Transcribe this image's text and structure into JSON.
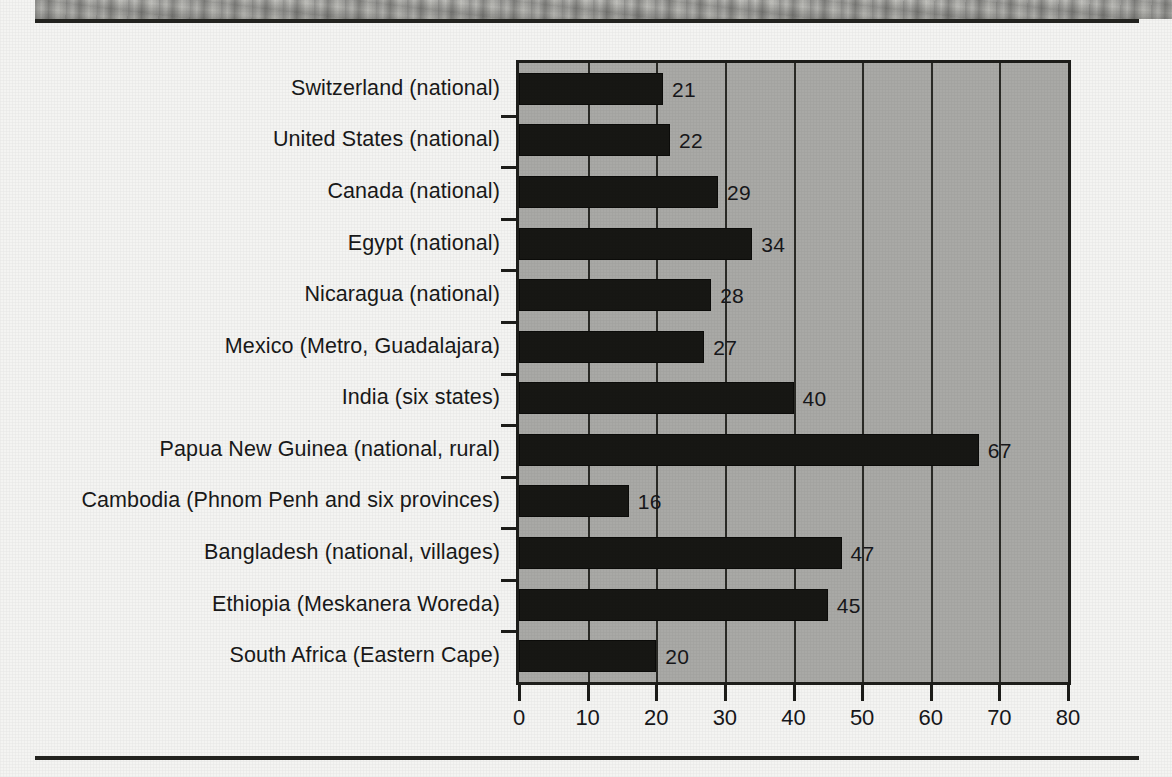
{
  "figure": {
    "background_color": "#f4f4f2",
    "plot_background_color": "#a9a9a6",
    "bar_color": "#171714",
    "axis_color": "#1d1d1a"
  },
  "chart_data": {
    "type": "bar",
    "orientation": "horizontal",
    "title": "",
    "subtitle": "",
    "xlabel": "",
    "ylabel": "",
    "xlim": [
      0,
      80
    ],
    "xticks": [
      0,
      10,
      20,
      30,
      40,
      50,
      60,
      70,
      80
    ],
    "xticklabels": [
      "0",
      "10",
      "20",
      "30",
      "40",
      "50",
      "60",
      "70",
      "80"
    ],
    "grid": true,
    "grid_axis": "x",
    "legend": false,
    "legend_position": "none",
    "data_labels": true,
    "categories": [
      "Switzerland (national)",
      "United States (national)",
      "Canada (national)",
      "Egypt (national)",
      "Nicaragua (national)",
      "Mexico (Metro, Guadalajara)",
      "India (six states)",
      "Papua New Guinea (national, rural)",
      "Cambodia (Phnom Penh and six provinces)",
      "Bangladesh (national, villages)",
      "Ethiopia (Meskanera Woreda)",
      "South Africa (Eastern Cape)"
    ],
    "values": [
      21,
      22,
      29,
      34,
      28,
      27,
      40,
      67,
      16,
      47,
      45,
      20
    ],
    "value_labels": [
      "21",
      "22",
      "29",
      "34",
      "28",
      "27",
      "40",
      "67",
      "16",
      "47",
      "45",
      "20"
    ]
  }
}
